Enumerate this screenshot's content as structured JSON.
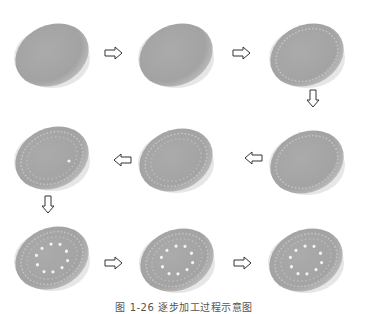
{
  "diagram": {
    "steps": [
      {
        "index": 1,
        "state": "plain surface",
        "holes_ring": false,
        "dots": 0
      },
      {
        "index": 2,
        "state": "plain surface",
        "holes_ring": false,
        "dots": 0
      },
      {
        "index": 3,
        "state": "outer ring of holes",
        "holes_ring": true,
        "dots": 0
      },
      {
        "index": 4,
        "state": "outer ring of holes",
        "holes_ring": true,
        "dots": 0
      },
      {
        "index": 5,
        "state": "two rings of holes",
        "holes_ring": true,
        "dots": 0
      },
      {
        "index": 6,
        "state": "rings of holes with first dot",
        "holes_ring": true,
        "dots": 1
      },
      {
        "index": 7,
        "state": "rings with inner dot circle",
        "holes_ring": true,
        "dots": 10
      },
      {
        "index": 8,
        "state": "rings with inner dot circle",
        "holes_ring": true,
        "dots": 10
      },
      {
        "index": 9,
        "state": "rings with inner dot circle",
        "holes_ring": true,
        "dots": 10
      }
    ],
    "flow": "serpentine: row1 left→right, down, row2 right→left, down, row3 left→right",
    "colors": {
      "disc": "#a6a6a6",
      "disc_edge": "#d9d9d9",
      "arrow_stroke": "#333333",
      "background": "#ffffff"
    }
  },
  "caption": "图 1-26  逐步加工过程示意图"
}
